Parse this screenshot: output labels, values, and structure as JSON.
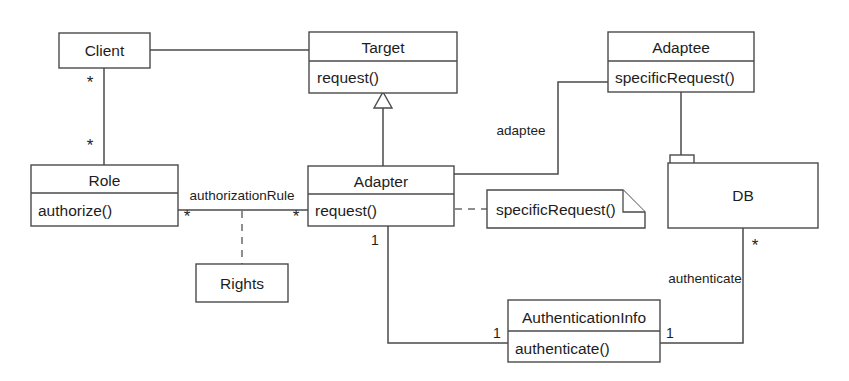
{
  "diagram": {
    "kind": "uml-class-diagram",
    "stroke_color": "#4a4a4a",
    "text_color": "#1d1d1d",
    "background_color": "#ffffff",
    "classes": {
      "client": {
        "name": "Client"
      },
      "target": {
        "name": "Target",
        "operation": "request()"
      },
      "adaptee": {
        "name": "Adaptee",
        "operation": "specificRequest()"
      },
      "role": {
        "name": "Role",
        "operation": "authorize()"
      },
      "adapter": {
        "name": "Adapter",
        "operation": "request()"
      },
      "rights": {
        "name": "Rights"
      },
      "db": {
        "name": "DB"
      },
      "authinfo": {
        "name": "AuthenticationInfo",
        "operation": "authenticate()"
      }
    },
    "note": {
      "text": "specificRequest()"
    },
    "association_labels": {
      "authorization_rule": "authorizationRule",
      "adaptee": "adaptee",
      "authenticate": "authenticate"
    },
    "multiplicities": {
      "client_end": "*",
      "role_end": "*",
      "role_assoc_end": "*",
      "adapter_assoc_end": "*",
      "adapter_bottom": "1",
      "authinfo_left": "1",
      "authinfo_right": "1",
      "db_end": "*"
    }
  }
}
